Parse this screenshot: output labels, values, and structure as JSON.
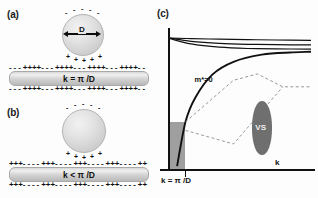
{
  "figure": {
    "panels": {
      "a": {
        "label": "(a)",
        "sphere_diameter_label": "D",
        "wire_label": "k = π /D",
        "charge_symbol_positive": "+",
        "charge_symbol_negative": "-"
      },
      "b": {
        "label": "(b)",
        "wire_label": "k < π /D",
        "charge_symbol_positive": "+",
        "charge_symbol_negative": "-"
      },
      "c": {
        "label": "(c)",
        "xlabel": "k",
        "ylabel": "",
        "tick_label": "k = π /D",
        "curve_label": "m*=0",
        "region_label": "VS"
      }
    }
  },
  "colors": {
    "sphere_fill": "#dcdcdc",
    "wire_fill": "#d2d2d2",
    "shaded_region": "#9a9a9a",
    "vs_region": "#6f6f6f",
    "curve_stroke": "#111111",
    "dashed_stroke": "#8c8c8c",
    "background": "#fdfdfd"
  },
  "chart_data": {
    "type": "line",
    "title": "",
    "xlabel": "k",
    "ylabel": "",
    "xlim": [
      0,
      1
    ],
    "ylim": [
      0,
      1
    ],
    "grid": false,
    "legend": null,
    "annotations": [
      {
        "text": "m*=0",
        "x": 0.16,
        "y": 0.62
      },
      {
        "text": "VS",
        "x": 0.66,
        "y": 0.27
      },
      {
        "text": "k = π /D",
        "x": 0.12,
        "y": -0.12
      }
    ],
    "tick_marks": [
      {
        "axis": "x",
        "value": 0.105,
        "label": "k = π /D"
      }
    ],
    "shaded_regions": [
      {
        "name": "forbidden-region",
        "x0": 0.0,
        "x1": 0.105,
        "y0": 0.0,
        "y1": 0.33,
        "color": "#9a9a9a"
      }
    ],
    "series": [
      {
        "name": "upper-band-1",
        "style": "solid",
        "x": [
          0.0,
          0.15,
          0.35,
          0.55,
          0.75,
          1.0
        ],
        "y": [
          0.915,
          0.912,
          0.908,
          0.905,
          0.902,
          0.9
        ]
      },
      {
        "name": "upper-band-2",
        "style": "solid",
        "x": [
          0.0,
          0.15,
          0.35,
          0.55,
          0.75,
          1.0
        ],
        "y": [
          0.915,
          0.893,
          0.878,
          0.872,
          0.869,
          0.868
        ]
      },
      {
        "name": "upper-band-3",
        "style": "solid",
        "x": [
          0.0,
          0.15,
          0.35,
          0.55,
          0.75,
          1.0
        ],
        "y": [
          0.912,
          0.875,
          0.852,
          0.843,
          0.84,
          0.838
        ]
      },
      {
        "name": "massless-branch",
        "style": "solid",
        "x": [
          0.05,
          0.11,
          0.18,
          0.3,
          0.45,
          0.65,
          0.85,
          1.0
        ],
        "y": [
          0.02,
          0.33,
          0.5,
          0.66,
          0.75,
          0.8,
          0.815,
          0.82
        ]
      },
      {
        "name": "vs-cone-upper",
        "style": "dashed",
        "x": [
          0.11,
          0.45,
          0.62,
          0.8,
          1.0
        ],
        "y": [
          0.33,
          0.62,
          0.665,
          0.575,
          0.575
        ]
      },
      {
        "name": "vs-cone-lower",
        "style": "dashed",
        "x": [
          0.11,
          0.45,
          0.8
        ],
        "y": [
          0.27,
          0.175,
          0.575
        ]
      }
    ]
  }
}
